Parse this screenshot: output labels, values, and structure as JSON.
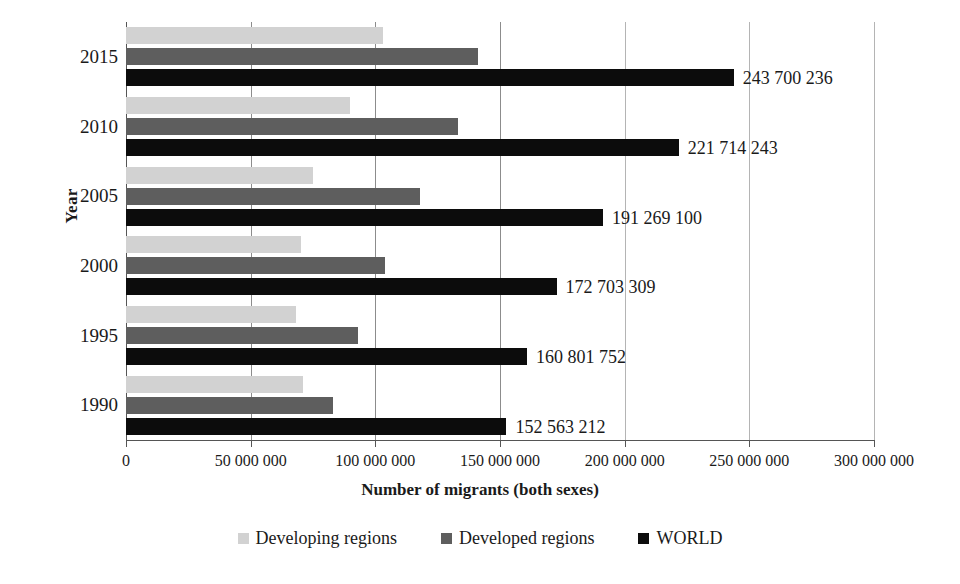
{
  "chart_data": {
    "type": "bar",
    "orientation": "horizontal",
    "title": "",
    "xlabel": "Number of migrants (both sexes)",
    "ylabel": "Year",
    "categories": [
      "1990",
      "1995",
      "2000",
      "2005",
      "2010",
      "2015"
    ],
    "category_order_top_to_bottom": [
      "2015",
      "2010",
      "2005",
      "2000",
      "1995",
      "1990"
    ],
    "xlim": [
      0,
      300000000
    ],
    "xticks": [
      0,
      50000000,
      100000000,
      150000000,
      200000000,
      250000000,
      300000000
    ],
    "xtick_labels": [
      "0",
      "50 000 000",
      "100 000 000",
      "150 000 000",
      "200 000 000",
      "250 000 000",
      "300 000 000"
    ],
    "grid": true,
    "legend_position": "bottom",
    "series": [
      {
        "name": "Developing regions",
        "color": "#d2d2d2",
        "values": [
          71000000,
          68000000,
          70000000,
          75000000,
          90000000,
          103000000
        ]
      },
      {
        "name": "Developed regions",
        "color": "#5e5e5e",
        "values": [
          83000000,
          93000000,
          104000000,
          118000000,
          133000000,
          141000000
        ]
      },
      {
        "name": "WORLD",
        "color": "#0c0c0c",
        "values": [
          152563212,
          160801752,
          172703309,
          191269100,
          221714243,
          243700236
        ],
        "data_labels": [
          "152 563 212",
          "160 801 752",
          "172 703 309",
          "191 269 100",
          "221 714 243",
          "243 700 236"
        ]
      }
    ]
  },
  "axes": {
    "y_title": "Year",
    "x_title": "Number of migrants (both sexes)",
    "y_tick_labels": [
      "2015",
      "2010",
      "2005",
      "2000",
      "1995",
      "1990"
    ],
    "x_tick_labels": [
      "0",
      "50 000 000",
      "100 000 000",
      "150 000 000",
      "200 000 000",
      "250 000 000",
      "300 000 000"
    ]
  },
  "legend": {
    "items": [
      {
        "label": "Developing regions",
        "color": "#d2d2d2"
      },
      {
        "label": "Developed regions",
        "color": "#5e5e5e"
      },
      {
        "label": "WORLD",
        "color": "#0c0c0c"
      }
    ]
  }
}
